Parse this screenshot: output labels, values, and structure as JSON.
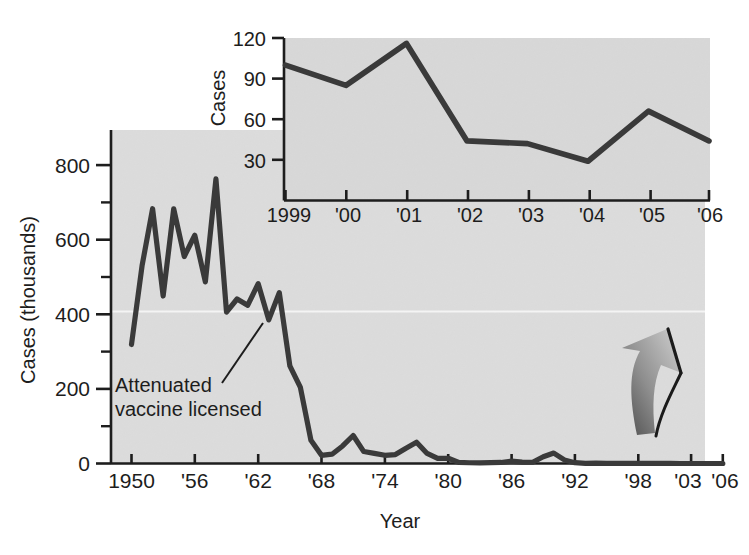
{
  "figure": {
    "background_color": "#ffffff",
    "plot_background_color": "#dcdcdc",
    "line_color": "#3a3a3a",
    "axis_color": "#1d1d1d",
    "gridline_color": "#f2f2f2"
  },
  "main": {
    "xlabel": "Year",
    "ylabel": "Cases (thousands)",
    "y_ticks": [
      "0",
      "200",
      "400",
      "600",
      "800"
    ],
    "y_minor_ticks": [
      "100",
      "300",
      "500",
      "700"
    ],
    "x_ticks": [
      "1950",
      "'56",
      "'62",
      "'68",
      "'74",
      "'80",
      "'86",
      "'92",
      "'98",
      "'03",
      "'06"
    ],
    "annotation": {
      "line1": "Attenuated",
      "line2": "vaccine licensed"
    }
  },
  "inset": {
    "ylabel": "Cases",
    "y_ticks": [
      "30",
      "60",
      "90",
      "120"
    ],
    "x_ticks": [
      "1999",
      "'00",
      "'01",
      "'02",
      "'03",
      "'04",
      "'05",
      "'06"
    ]
  },
  "decoration": {
    "arrow_label": "curved-up-arrow"
  },
  "chart_data": [
    {
      "id": "main",
      "type": "line",
      "title": "",
      "xlabel": "Year",
      "ylabel": "Cases (thousands)",
      "xlim": [
        1950,
        2006
      ],
      "ylim": [
        0,
        870
      ],
      "y_ticks": [
        0,
        200,
        400,
        600,
        800
      ],
      "y_minor_ticks": [
        100,
        300,
        500,
        700
      ],
      "x_ticks": [
        1950,
        1956,
        1962,
        1968,
        1974,
        1980,
        1986,
        1992,
        1998,
        2003,
        2006
      ],
      "x_tick_labels": [
        "1950",
        "'56",
        "'62",
        "'68",
        "'74",
        "'80",
        "'86",
        "'92",
        "'98",
        "'03",
        "'06"
      ],
      "grid": "single faint white horizontal line at y=400",
      "legend": "none",
      "annotations": [
        {
          "text": "Attenuated vaccine licensed",
          "points_to_year": 1963,
          "points_to_value": 385
        }
      ],
      "x": [
        1950,
        1951,
        1952,
        1953,
        1954,
        1955,
        1956,
        1957,
        1958,
        1959,
        1960,
        1961,
        1962,
        1963,
        1964,
        1965,
        1966,
        1967,
        1968,
        1969,
        1970,
        1971,
        1972,
        1973,
        1974,
        1975,
        1976,
        1977,
        1978,
        1979,
        1980,
        1981,
        1982,
        1983,
        1984,
        1985,
        1986,
        1987,
        1988,
        1989,
        1990,
        1991,
        1992,
        1993,
        1994,
        1995,
        1996,
        1997,
        1998,
        1999,
        2000,
        2001,
        2002,
        2003,
        2004,
        2005,
        2006
      ],
      "values": [
        319,
        530,
        683,
        449,
        683,
        555,
        612,
        487,
        763,
        406,
        441,
        424,
        482,
        385,
        458,
        262,
        204,
        62,
        22,
        25,
        47,
        75,
        32,
        27,
        22,
        24,
        41,
        57,
        27,
        14,
        14,
        3,
        2,
        1.5,
        2.6,
        2.8,
        6.3,
        3.7,
        3.4,
        18,
        28,
        9.6,
        2.2,
        0.3,
        0.96,
        0.31,
        0.5,
        0.14,
        0.1,
        0.1,
        0.086,
        0.116,
        0.044,
        0.042,
        0.029,
        0.066,
        0.044
      ]
    },
    {
      "id": "inset",
      "type": "line",
      "title": "",
      "xlabel": "",
      "ylabel": "Cases",
      "xlim": [
        1999,
        2006
      ],
      "ylim": [
        0,
        125
      ],
      "y_ticks": [
        30,
        60,
        90,
        120
      ],
      "x_ticks": [
        1999,
        2000,
        2001,
        2002,
        2003,
        2004,
        2005,
        2006
      ],
      "x_tick_labels": [
        "1999",
        "'00",
        "'01",
        "'02",
        "'03",
        "'04",
        "'05",
        "'06"
      ],
      "grid": "off",
      "legend": "none",
      "x": [
        1999,
        2000,
        2001,
        2002,
        2003,
        2004,
        2005,
        2006
      ],
      "values": [
        100,
        85,
        116,
        44,
        42,
        29,
        66,
        44
      ]
    }
  ]
}
